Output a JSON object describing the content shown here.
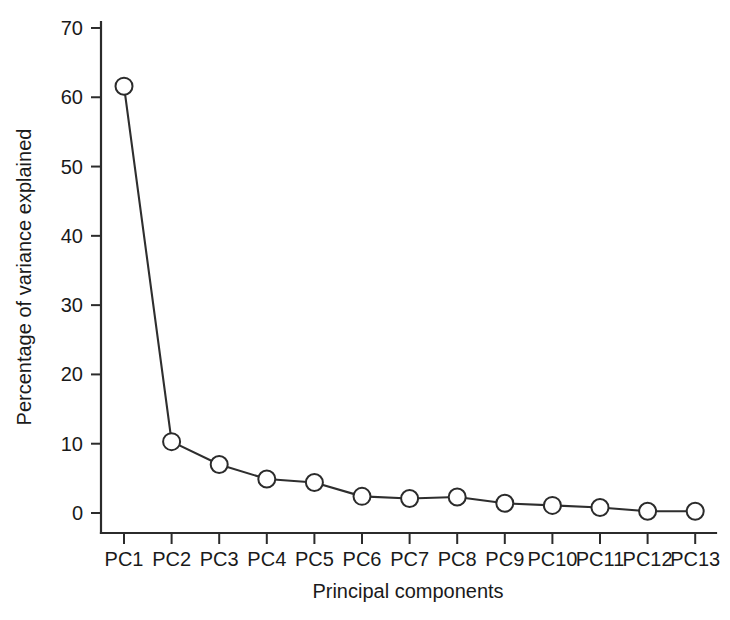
{
  "chart_data": {
    "type": "line",
    "title": "",
    "subtitle": "",
    "xlabel": "Principal components",
    "ylabel": "Percentage of variance explained",
    "categories": [
      "PC1",
      "PC2",
      "PC3",
      "PC4",
      "PC5",
      "PC6",
      "PC7",
      "PC8",
      "PC9",
      "PC10",
      "PC11",
      "PC12",
      "PC13"
    ],
    "values": [
      61.6,
      10.3,
      7.0,
      4.9,
      4.4,
      2.4,
      2.1,
      2.3,
      1.4,
      1.1,
      0.8,
      0.25,
      0.25
    ],
    "series": [
      {
        "name": "Percentage of variance explained",
        "values": [
          61.6,
          10.3,
          7.0,
          4.9,
          4.4,
          2.4,
          2.1,
          2.3,
          1.4,
          1.1,
          0.8,
          0.25,
          0.25
        ]
      }
    ],
    "ylim": [
      0,
      70
    ],
    "yticks": [
      0,
      10,
      20,
      30,
      40,
      50,
      60,
      70
    ],
    "ytick_labels": [
      "0",
      "10",
      "20",
      "30",
      "40",
      "50",
      "60",
      "70"
    ],
    "xtick_labels": [
      "PC1",
      "PC2",
      "PC3",
      "PC4",
      "PC5",
      "PC6",
      "PC7",
      "PC8",
      "PC9",
      "PC10",
      "PC11",
      "PC12",
      "PC13"
    ],
    "grid": false,
    "legend": "none",
    "marker": "open-circle",
    "line_color": "#2e2e2e",
    "marker_fill": "#ffffff",
    "marker_stroke": "#2b2b2b",
    "axis_color": "#2b2b2b",
    "background": "#ffffff",
    "axis_style": "L-shaped (left and bottom spines only)"
  },
  "axes": {
    "y_title": "Percentage of variance explained",
    "x_title": "Principal components"
  }
}
